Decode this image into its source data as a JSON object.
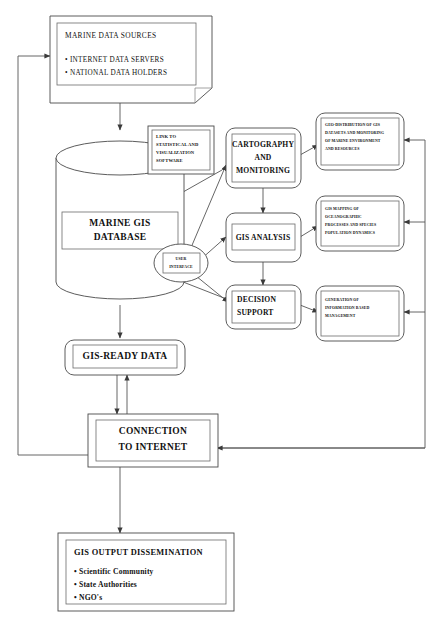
{
  "diagram": {
    "title_faint": "",
    "style": {
      "stroke": "#4a4a4a",
      "inner_stroke": "#6b6b6b",
      "connector": "#555555",
      "fill": "#ffffff",
      "text": "#111111"
    },
    "nodes": {
      "marine_data_sources": {
        "title": "MARINE DATA SOURCES",
        "bullets": [
          "• INTERNET DATA SERVERS",
          "• NATIONAL DATA HOLDERS"
        ],
        "shape": "document-folded-corner"
      },
      "marine_gis_database": {
        "line1": "MARINE GIS",
        "line2": "DATABASE",
        "shape": "cylinder"
      },
      "link_software": {
        "lines": [
          "LINK TO",
          "STATISTICAL AND",
          "VISUALIZATION",
          "SOFTWARE"
        ],
        "shape": "rectangle"
      },
      "user_interface": {
        "line1": "USER",
        "line2": "INTERFACE",
        "shape": "ellipse"
      },
      "cartography_monitoring": {
        "lines": [
          "CARTOGRAPHY",
          "AND",
          "MONITORING"
        ],
        "shape": "rounded-rectangle"
      },
      "gis_analysis": {
        "lines": [
          "GIS ANALYSIS"
        ],
        "shape": "rounded-rectangle"
      },
      "decision_support": {
        "lines": [
          "DECISION",
          "SUPPORT"
        ],
        "shape": "rounded-rectangle"
      },
      "geo_distribution": {
        "lines": [
          "GEO-DISTRIBUTION OF GIS",
          "DATASETS AND MONITORING",
          "OF MARINE  ENVIRONMENT",
          "AND RESOURCES"
        ],
        "shape": "rounded-rectangle"
      },
      "gis_mapping": {
        "lines": [
          "GIS MAPPING OF",
          "OCEANOGRAPHIC",
          "PROCESSES AND SPECIES",
          "POPULATION DYNAMICS"
        ],
        "shape": "rounded-rectangle"
      },
      "information_management": {
        "lines": [
          "GENERATION OF",
          "INFORMATION BASED",
          "MANAGEMENT"
        ],
        "shape": "rounded-rectangle"
      },
      "gis_ready_data": {
        "lines": [
          "GIS-READY DATA"
        ],
        "shape": "rounded-rectangle"
      },
      "connection_internet": {
        "line1": "CONNECTION",
        "line2": "TO INTERNET",
        "shape": "rectangle"
      },
      "gis_output_dissemination": {
        "title": "GIS OUTPUT DISSEMINATION",
        "bullets": [
          "• Scientific Community",
          "• State Authorities",
          "• NGO's"
        ],
        "shape": "rectangle"
      }
    }
  }
}
